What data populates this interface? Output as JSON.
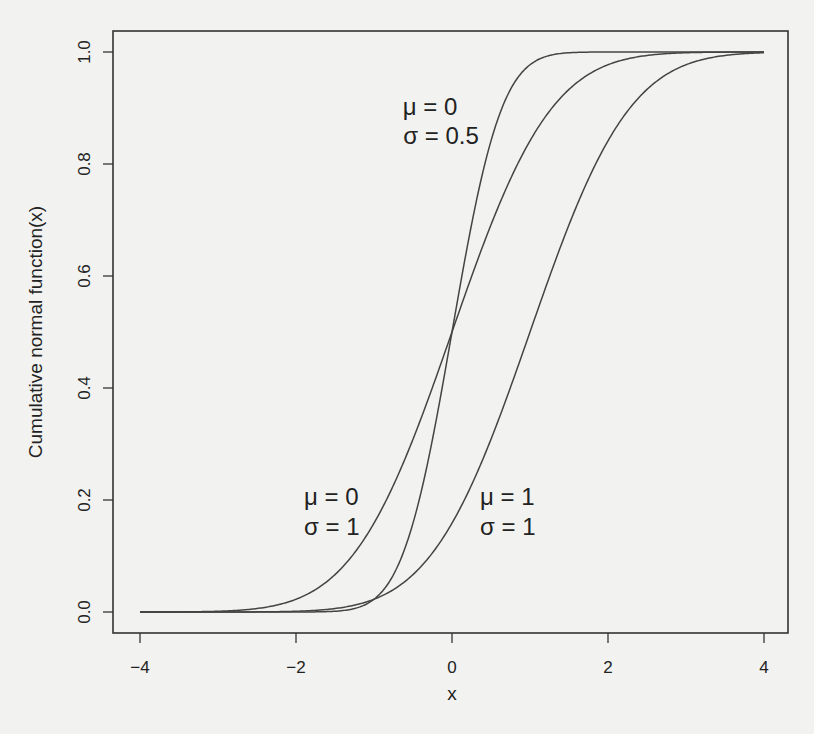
{
  "chart_data": {
    "type": "line",
    "title": "",
    "xlabel": "x",
    "ylabel": "Cumulative normal function(x)",
    "xlim": [
      -4.35,
      4.3
    ],
    "ylim": [
      -0.038,
      1.038
    ],
    "x_ticks": [
      -4,
      -2,
      0,
      2,
      4
    ],
    "x_tick_labels": [
      "−4",
      "−2",
      "0",
      "2",
      "4"
    ],
    "y_ticks": [
      0.0,
      0.2,
      0.4,
      0.6,
      0.8,
      1.0
    ],
    "y_tick_labels": [
      "0.0",
      "0.2",
      "0.4",
      "0.6",
      "0.8",
      "1.0"
    ],
    "grid": false,
    "legend": "none",
    "x_range": [
      -4,
      4
    ],
    "series": [
      {
        "name": "mu=0, sigma=1",
        "mu": 0,
        "sigma": 1,
        "x": [
          -4,
          -3,
          -2,
          -1,
          0,
          1,
          2,
          3,
          4
        ],
        "values": [
          3e-05,
          0.0013,
          0.0228,
          0.1587,
          0.5,
          0.8413,
          0.9772,
          0.9987,
          1.0
        ]
      },
      {
        "name": "mu=0, sigma=0.5",
        "mu": 0,
        "sigma": 0.5,
        "x": [
          -4,
          -3,
          -2,
          -1,
          -0.5,
          0,
          0.5,
          1,
          2,
          3,
          4
        ],
        "values": [
          0.0,
          0.0,
          3e-05,
          0.0228,
          0.1587,
          0.5,
          0.8413,
          0.9772,
          1.0,
          1.0,
          1.0
        ]
      },
      {
        "name": "mu=1, sigma=1",
        "mu": 1,
        "sigma": 1,
        "x": [
          -4,
          -3,
          -2,
          -1,
          0,
          1,
          2,
          3,
          4
        ],
        "values": [
          0.0,
          3e-05,
          0.0013,
          0.0228,
          0.1587,
          0.5,
          0.8413,
          0.9772,
          0.9987
        ]
      }
    ],
    "annotations": [
      {
        "id": "a1",
        "line1": "μ = 0",
        "line2": "σ = 0.5",
        "x": 0.3,
        "y": 0.85
      },
      {
        "id": "a2",
        "line1": "μ = 0",
        "line2": "σ = 1",
        "x": -1.8,
        "y": 0.2
      },
      {
        "id": "a3",
        "line1": "μ = 1",
        "line2": "σ = 1",
        "x": 1.2,
        "y": 0.2
      }
    ]
  },
  "style": {
    "line_color": "#444444",
    "frame_color": "#333333",
    "background": "#f2f2f0"
  }
}
